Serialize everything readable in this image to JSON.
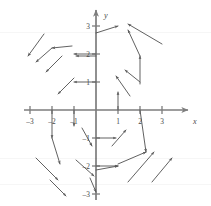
{
  "figure": {
    "type": "direction-field",
    "kind": "vector-field-plot",
    "background": "#ffffff",
    "stroke_color": "#595959",
    "axis_color": "#7d7d7d"
  },
  "axes": {
    "x_label": "x",
    "y_label": "y",
    "origin_px": [
      96,
      110
    ],
    "unit_px": [
      22,
      28
    ],
    "x_ticks": [
      {
        "value": -3,
        "label": "–3",
        "px": 30
      },
      {
        "value": -2,
        "label": "–2",
        "px": 52
      },
      {
        "value": -1,
        "label": "–1",
        "px": 74
      },
      {
        "value": 1,
        "label": "1",
        "px": 118
      },
      {
        "value": 2,
        "label": "2",
        "px": 140
      },
      {
        "value": 3,
        "label": "3",
        "px": 162
      }
    ],
    "y_ticks": [
      {
        "value": 3,
        "label": "3",
        "px": 26
      },
      {
        "value": 2,
        "label": "2",
        "px": 54
      },
      {
        "value": 1,
        "label": "1",
        "px": 82
      },
      {
        "value": -1,
        "label": "–1",
        "px": 138
      },
      {
        "value": -2,
        "label": "–2",
        "px": 166
      },
      {
        "value": -3,
        "label": "–3",
        "px": 194
      }
    ],
    "x_range": [
      -3.4,
      3.6
    ],
    "y_range": [
      -3.3,
      3.3
    ]
  },
  "chart_data": {
    "type": "scatter",
    "title": "",
    "xlabel": "x",
    "ylabel": "y",
    "xlim": [
      -3.4,
      3.6
    ],
    "ylim": [
      -3.3,
      3.3
    ],
    "grid": false,
    "legend": null,
    "rotation_sense": "clockwise",
    "vectors": [
      {
        "x0": 96,
        "y0": 33,
        "x1": 118,
        "y1": 26
      },
      {
        "x0": 96,
        "y0": 54,
        "x1": 74,
        "y1": 54
      },
      {
        "x0": 96,
        "y0": 82,
        "x1": 74,
        "y1": 82
      },
      {
        "x0": 140,
        "y0": 84,
        "x1": 140,
        "y1": 56
      },
      {
        "x0": 140,
        "y0": 56,
        "x1": 128,
        "y1": 30
      },
      {
        "x0": 162,
        "y0": 44,
        "x1": 128,
        "y1": 24
      },
      {
        "x0": 140,
        "y0": 82,
        "x1": 125,
        "y1": 70
      },
      {
        "x0": 130,
        "y0": 96,
        "x1": 116,
        "y1": 76
      },
      {
        "x0": 118,
        "y0": 110,
        "x1": 118,
        "y1": 92
      },
      {
        "x0": 96,
        "y0": 56,
        "x1": 76,
        "y1": 56
      },
      {
        "x0": 72,
        "y0": 46,
        "x1": 52,
        "y1": 48
      },
      {
        "x0": 52,
        "y0": 48,
        "x1": 36,
        "y1": 62
      },
      {
        "x0": 44,
        "y0": 34,
        "x1": 28,
        "y1": 56
      },
      {
        "x0": 62,
        "y0": 56,
        "x1": 46,
        "y1": 72
      },
      {
        "x0": 74,
        "y0": 78,
        "x1": 58,
        "y1": 94
      },
      {
        "x0": 74,
        "y0": 110,
        "x1": 74,
        "y1": 126
      },
      {
        "x0": 52,
        "y0": 110,
        "x1": 52,
        "y1": 138
      },
      {
        "x0": 52,
        "y0": 138,
        "x1": 60,
        "y1": 164
      },
      {
        "x0": 36,
        "y0": 158,
        "x1": 58,
        "y1": 180
      },
      {
        "x0": 50,
        "y0": 180,
        "x1": 66,
        "y1": 196
      },
      {
        "x0": 96,
        "y0": 138,
        "x1": 116,
        "y1": 138
      },
      {
        "x0": 82,
        "y0": 128,
        "x1": 92,
        "y1": 146
      },
      {
        "x0": 96,
        "y0": 166,
        "x1": 118,
        "y1": 166
      },
      {
        "x0": 76,
        "y0": 160,
        "x1": 94,
        "y1": 176
      },
      {
        "x0": 90,
        "y0": 178,
        "x1": 96,
        "y1": 192
      },
      {
        "x0": 96,
        "y0": 170,
        "x1": 118,
        "y1": 166
      },
      {
        "x0": 118,
        "y0": 164,
        "x1": 146,
        "y1": 152
      },
      {
        "x0": 140,
        "y0": 110,
        "x1": 146,
        "y1": 152
      },
      {
        "x0": 112,
        "y0": 146,
        "x1": 126,
        "y1": 130
      },
      {
        "x0": 128,
        "y0": 182,
        "x1": 154,
        "y1": 152
      },
      {
        "x0": 152,
        "y0": 182,
        "x1": 172,
        "y1": 158
      }
    ]
  }
}
